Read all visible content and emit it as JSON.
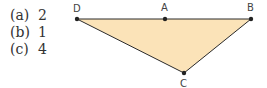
{
  "options": [
    {
      "key": "(a)",
      "value": "2"
    },
    {
      "key": "(b)",
      "value": "1"
    },
    {
      "key": "(c)",
      "value": "4"
    }
  ],
  "figure": {
    "fill": "#fbe3b8",
    "stroke": "#2a2a2a",
    "points": {
      "D": {
        "label": "D",
        "x": 77,
        "y": 19
      },
      "A": {
        "label": "A",
        "x": 165,
        "y": 20
      },
      "B": {
        "label": "B",
        "x": 251,
        "y": 19
      },
      "C": {
        "label": "C",
        "x": 184,
        "y": 73
      }
    }
  }
}
